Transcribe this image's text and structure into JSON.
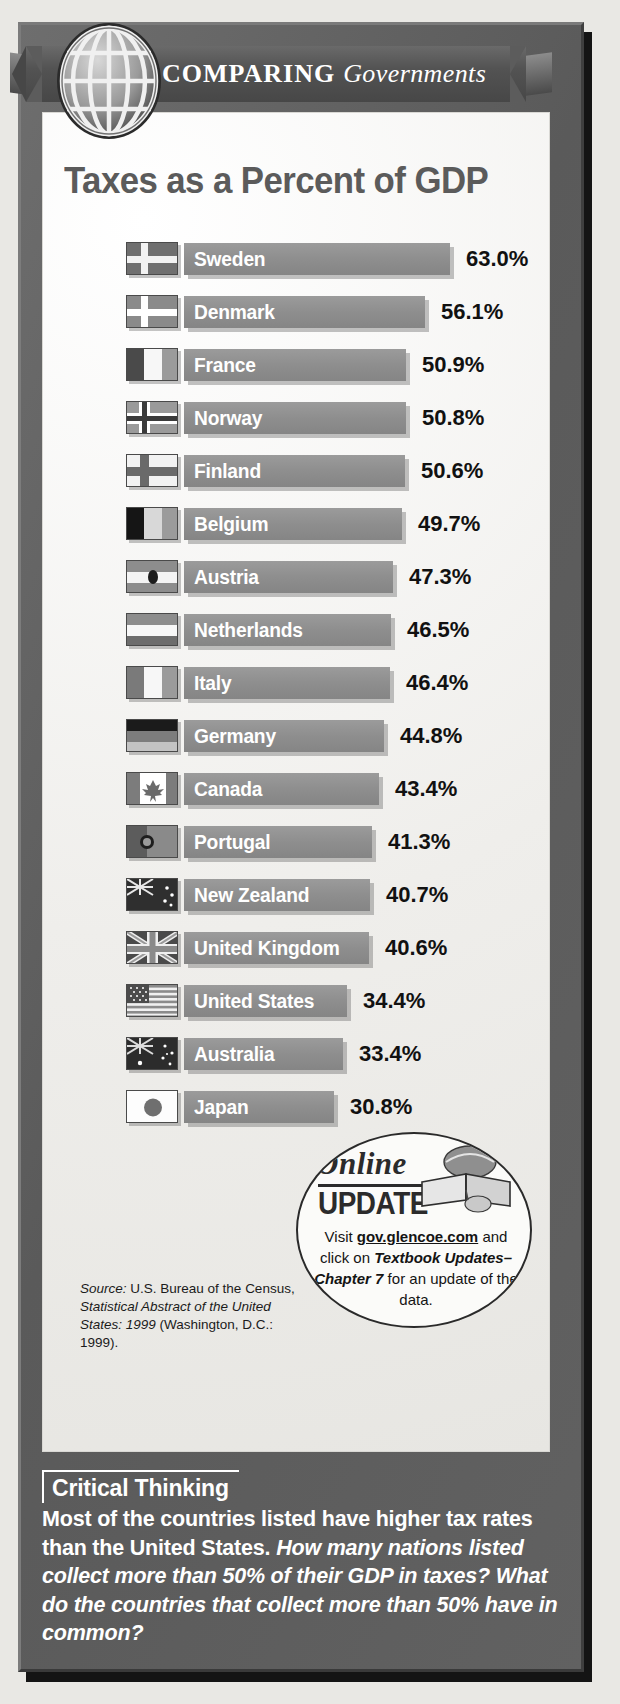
{
  "banner": {
    "main": "COMPARING",
    "sub": "Governments",
    "globe_icon": "globe-icon"
  },
  "chart_title": "Taxes as a Percent of GDP",
  "chart_data": {
    "type": "bar",
    "title": "Taxes as a Percent of GDP",
    "xlabel": "",
    "ylabel": "",
    "orientation": "horizontal",
    "xlim": [
      0,
      63.0
    ],
    "grid": false,
    "legend": null,
    "categories": [
      "Sweden",
      "Denmark",
      "France",
      "Norway",
      "Finland",
      "Belgium",
      "Austria",
      "Netherlands",
      "Italy",
      "Germany",
      "Canada",
      "Portugal",
      "New Zealand",
      "United Kingdom",
      "United States",
      "Australia",
      "Japan"
    ],
    "values": [
      63.0,
      56.1,
      50.9,
      50.8,
      50.6,
      49.7,
      47.3,
      46.5,
      46.4,
      44.8,
      43.4,
      41.3,
      40.7,
      40.6,
      34.4,
      33.4,
      30.8
    ],
    "value_labels": [
      "63.0%",
      "56.1%",
      "50.9%",
      "50.8%",
      "50.6%",
      "49.7%",
      "47.3%",
      "46.5%",
      "46.4%",
      "44.8%",
      "43.4%",
      "41.3%",
      "40.7%",
      "40.6%",
      "34.4%",
      "33.4%",
      "30.8%"
    ]
  },
  "rows": [
    {
      "country": "Sweden",
      "value": 63.0,
      "pct": "63.0%",
      "flag": "flag-sweden"
    },
    {
      "country": "Denmark",
      "value": 56.1,
      "pct": "56.1%",
      "flag": "flag-denmark"
    },
    {
      "country": "France",
      "value": 50.9,
      "pct": "50.9%",
      "flag": "flag-france"
    },
    {
      "country": "Norway",
      "value": 50.8,
      "pct": "50.8%",
      "flag": "flag-norway"
    },
    {
      "country": "Finland",
      "value": 50.6,
      "pct": "50.6%",
      "flag": "flag-finland"
    },
    {
      "country": "Belgium",
      "value": 49.7,
      "pct": "49.7%",
      "flag": "flag-belgium"
    },
    {
      "country": "Austria",
      "value": 47.3,
      "pct": "47.3%",
      "flag": "flag-austria"
    },
    {
      "country": "Netherlands",
      "value": 46.5,
      "pct": "46.5%",
      "flag": "flag-netherlands"
    },
    {
      "country": "Italy",
      "value": 46.4,
      "pct": "46.4%",
      "flag": "flag-italy"
    },
    {
      "country": "Germany",
      "value": 44.8,
      "pct": "44.8%",
      "flag": "flag-germany"
    },
    {
      "country": "Canada",
      "value": 43.4,
      "pct": "43.4%",
      "flag": "flag-canada"
    },
    {
      "country": "Portugal",
      "value": 41.3,
      "pct": "41.3%",
      "flag": "flag-portugal"
    },
    {
      "country": "New Zealand",
      "value": 40.7,
      "pct": "40.7%",
      "flag": "flag-new-zealand"
    },
    {
      "country": "United Kingdom",
      "value": 40.6,
      "pct": "40.6%",
      "flag": "flag-united-kingdom"
    },
    {
      "country": "United States",
      "value": 34.4,
      "pct": "34.4%",
      "flag": "flag-united-states"
    },
    {
      "country": "Australia",
      "value": 33.4,
      "pct": "33.4%",
      "flag": "flag-australia"
    },
    {
      "country": "Japan",
      "value": 30.8,
      "pct": "30.8%",
      "flag": "flag-japan"
    }
  ],
  "source": {
    "label": "Source:",
    "line1": " U.S. Bureau of the",
    "line2_plain": "Census, ",
    "line2_italic": "Statistical Abstract",
    "line3_italic": "of the United States: 1999",
    "line4": "(Washington, D.C.: 1999)."
  },
  "online_update": {
    "online": "Online",
    "update": "UPDATE",
    "book_icon": "open-book-icon",
    "text_pre": "Visit ",
    "link": "gov.glencoe.com",
    "text_mid": " and click on ",
    "bold_italic": "Textbook Updates–Chapter 7",
    "text_post": " for an update of the data."
  },
  "critical_thinking": {
    "headline": "Critical Thinking",
    "lead": "Most of the countries listed have higher tax rates than the United States.",
    "question": "How many nations listed collect more than 50% of their GDP in taxes? What do the countries that collect more than 50% have in common?"
  },
  "colors": {
    "frame": "#5f5f5f",
    "panel": "#f4f3f0",
    "bar": "#8e8e8e",
    "title": "#5b5b5b",
    "text": "#111111"
  }
}
